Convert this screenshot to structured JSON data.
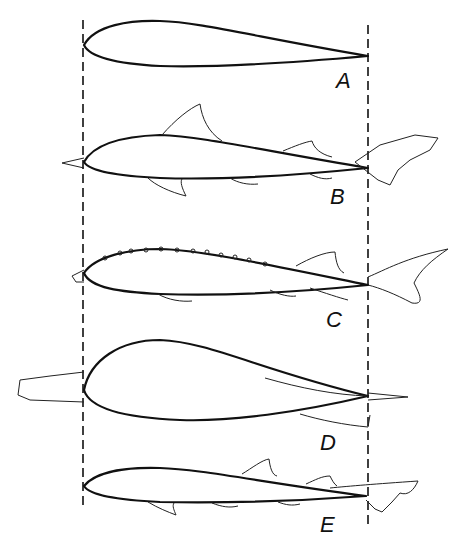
{
  "diagram": {
    "reference_lines": {
      "style": "dashed vertical",
      "left_x": 83,
      "right_x": 368
    },
    "figures": [
      {
        "label": "A",
        "subject": "streamlined body profile (airfoil)"
      },
      {
        "label": "B",
        "subject": "shark outline overlaid on profile"
      },
      {
        "label": "C",
        "subject": "sturgeon outline overlaid on profile"
      },
      {
        "label": "D",
        "subject": "broad-bodied fish outline overlaid on profile"
      },
      {
        "label": "E",
        "subject": "slender shark outline overlaid on profile"
      }
    ]
  }
}
